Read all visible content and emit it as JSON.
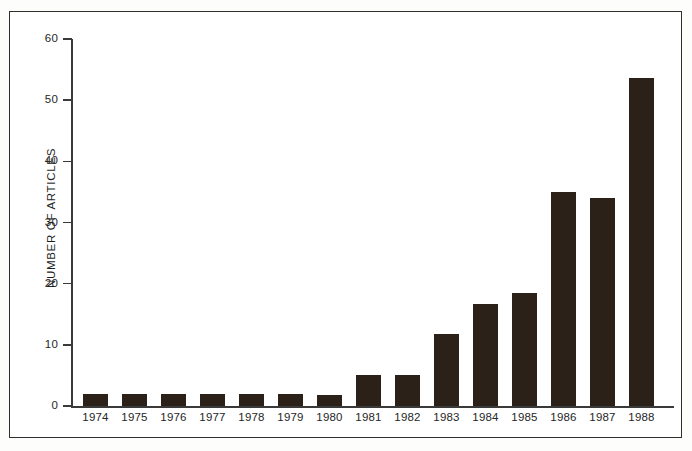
{
  "chart_data": {
    "type": "bar",
    "title": "",
    "xlabel": "",
    "ylabel": "NUMBER OF ARTICLES",
    "ylim": [
      0,
      60
    ],
    "yticks": [
      0,
      10,
      20,
      30,
      40,
      50,
      60
    ],
    "ytick_labels": [
      "0",
      "10",
      "20",
      "30",
      "40",
      "50",
      "60"
    ],
    "grid": false,
    "legend": "none",
    "bar_color": "#2b2119",
    "axis_color": "#3a3a3a",
    "background": "#ffffff",
    "categories": [
      "1974",
      "1975",
      "1976",
      "1977",
      "1978",
      "1979",
      "1980",
      "1981",
      "1982",
      "1983",
      "1984",
      "1985",
      "1986",
      "1987",
      "1988"
    ],
    "values": [
      2,
      2,
      2,
      2,
      2,
      2,
      1.8,
      5,
      5,
      11.7,
      16.6,
      18.4,
      35,
      34,
      53.7
    ]
  }
}
